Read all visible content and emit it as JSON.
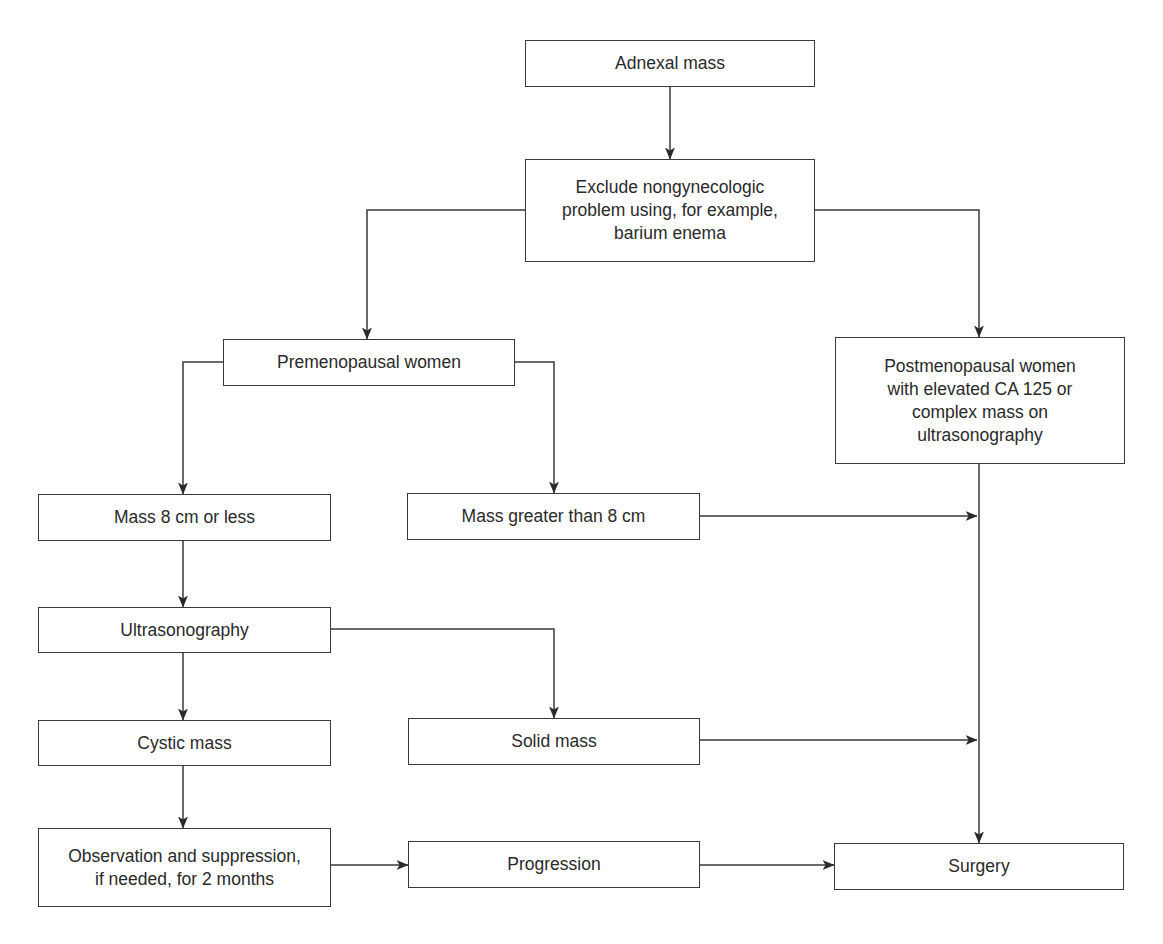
{
  "diagram": {
    "type": "flowchart",
    "colors": {
      "line": "#3a3a3a",
      "text": "#2a2a2a",
      "background": "#ffffff"
    },
    "nodes": [
      {
        "id": "adnexal",
        "label": "Adnexal mass",
        "x": 525,
        "y": 40,
        "w": 290,
        "h": 47
      },
      {
        "id": "exclude",
        "label": "Exclude nongynecologic\nproblem using, for example,\nbarium enema",
        "x": 525,
        "y": 159,
        "w": 290,
        "h": 103
      },
      {
        "id": "premeno",
        "label": "Premenopausal women",
        "x": 223,
        "y": 339,
        "w": 292,
        "h": 47
      },
      {
        "id": "postmeno",
        "label": "Postmenopausal women\nwith elevated CA 125 or\ncomplex mass on\nultrasonography",
        "x": 835,
        "y": 337,
        "w": 290,
        "h": 127
      },
      {
        "id": "mass_small",
        "label": "Mass 8 cm or less",
        "x": 38,
        "y": 494,
        "w": 293,
        "h": 47
      },
      {
        "id": "mass_large",
        "label": "Mass greater than 8 cm",
        "x": 407,
        "y": 493,
        "w": 293,
        "h": 47
      },
      {
        "id": "ultra",
        "label": "Ultrasonography",
        "x": 38,
        "y": 607,
        "w": 293,
        "h": 46
      },
      {
        "id": "cystic",
        "label": "Cystic mass",
        "x": 38,
        "y": 720,
        "w": 293,
        "h": 46
      },
      {
        "id": "solid",
        "label": "Solid mass",
        "x": 408,
        "y": 718,
        "w": 292,
        "h": 47
      },
      {
        "id": "observe",
        "label": "Observation and suppression,\nif needed, for 2 months",
        "x": 38,
        "y": 828,
        "w": 293,
        "h": 79
      },
      {
        "id": "progress",
        "label": "Progression",
        "x": 408,
        "y": 841,
        "w": 292,
        "h": 47
      },
      {
        "id": "surgery",
        "label": "Surgery",
        "x": 834,
        "y": 843,
        "w": 290,
        "h": 47
      }
    ],
    "edges": [
      {
        "from": "adnexal",
        "to": "exclude",
        "path": [
          [
            670,
            87
          ],
          [
            670,
            159
          ]
        ]
      },
      {
        "from": "exclude",
        "to": "premeno",
        "path": [
          [
            525,
            210
          ],
          [
            367,
            210
          ],
          [
            367,
            339
          ]
        ]
      },
      {
        "from": "exclude",
        "to": "postmeno",
        "path": [
          [
            815,
            210
          ],
          [
            979,
            210
          ],
          [
            979,
            337
          ]
        ]
      },
      {
        "from": "premeno",
        "to": "mass_small",
        "path": [
          [
            223,
            362
          ],
          [
            183,
            362
          ],
          [
            183,
            494
          ]
        ]
      },
      {
        "from": "premeno",
        "to": "mass_large",
        "path": [
          [
            515,
            362
          ],
          [
            554,
            362
          ],
          [
            554,
            493
          ]
        ]
      },
      {
        "from": "mass_large",
        "to": "surgery_line",
        "path": [
          [
            700,
            516
          ],
          [
            977,
            516
          ]
        ]
      },
      {
        "from": "mass_small",
        "to": "ultra",
        "path": [
          [
            183,
            541
          ],
          [
            183,
            607
          ]
        ]
      },
      {
        "from": "ultra",
        "to": "solid",
        "path": [
          [
            331,
            629
          ],
          [
            554,
            629
          ],
          [
            554,
            718
          ]
        ]
      },
      {
        "from": "ultra",
        "to": "cystic",
        "path": [
          [
            183,
            653
          ],
          [
            183,
            720
          ]
        ]
      },
      {
        "from": "solid",
        "to": "surgery_line",
        "path": [
          [
            700,
            740
          ],
          [
            977,
            740
          ]
        ]
      },
      {
        "from": "postmeno",
        "to": "surgery",
        "path": [
          [
            979,
            464
          ],
          [
            979,
            843
          ]
        ]
      },
      {
        "from": "cystic",
        "to": "observe",
        "path": [
          [
            183,
            766
          ],
          [
            183,
            828
          ]
        ]
      },
      {
        "from": "observe",
        "to": "progress",
        "path": [
          [
            331,
            865
          ],
          [
            408,
            865
          ]
        ]
      },
      {
        "from": "progress",
        "to": "surgery",
        "path": [
          [
            700,
            865
          ],
          [
            834,
            865
          ]
        ]
      }
    ]
  }
}
